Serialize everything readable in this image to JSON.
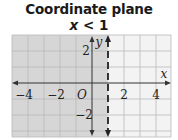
{
  "title": "Coordinate plane",
  "inequality": {
    "var": "x",
    "op": "<",
    "value": "1"
  },
  "colors": {
    "shade": "#d9d9d9",
    "grid_line": "#b8b8b8",
    "unshaded": "#f2f2f2",
    "axis": "#222222"
  },
  "axes": {
    "x_label": "x",
    "y_label": "y",
    "origin_label": "O",
    "x_ticks": [
      "−4",
      "−2",
      "2",
      "4"
    ],
    "y_ticks": [
      "2",
      "−2"
    ]
  },
  "boundary": {
    "x": 1,
    "style": "dashed"
  },
  "grid": {
    "x_min": -5,
    "x_max": 5,
    "y_min": -3,
    "y_max": 3
  }
}
